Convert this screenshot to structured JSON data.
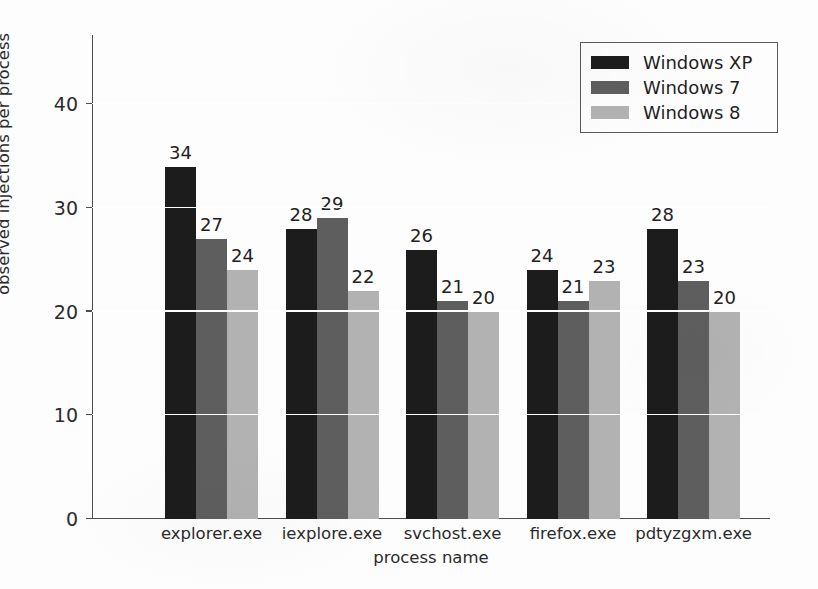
{
  "chart_data": {
    "type": "bar",
    "title": "",
    "xlabel": "process name",
    "ylabel": "observed injections per process",
    "categories": [
      "explorer.exe",
      "iexplore.exe",
      "svchost.exe",
      "firefox.exe",
      "pdtyzgxm.exe"
    ],
    "series": [
      {
        "name": "Windows XP",
        "color": "#1c1c1c",
        "values": [
          34,
          28,
          26,
          24,
          28
        ]
      },
      {
        "name": "Windows 7",
        "color": "#5e5e5e",
        "values": [
          27,
          29,
          21,
          21,
          23
        ]
      },
      {
        "name": "Windows 8",
        "color": "#b2b2b2",
        "values": [
          24,
          22,
          20,
          23,
          20
        ]
      }
    ],
    "ylim": [
      0,
      46.7
    ],
    "yticks": [
      0,
      10,
      20,
      30,
      40
    ],
    "ytick_labels": [
      "0",
      "10",
      "20",
      "30",
      "40"
    ],
    "grid": "horizontal-white-over-bars",
    "legend_position": "top-right",
    "bar_labels": "value above each bar"
  },
  "legend": {
    "items": [
      {
        "label": "Windows XP",
        "color": "#1c1c1c"
      },
      {
        "label": "Windows 7",
        "color": "#5e5e5e"
      },
      {
        "label": "Windows 8",
        "color": "#b2b2b2"
      }
    ]
  }
}
